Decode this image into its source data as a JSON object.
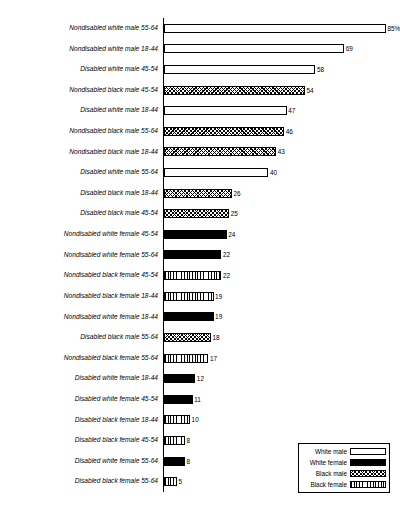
{
  "chart_data": {
    "type": "bar",
    "orientation": "horizontal",
    "title": "",
    "xlabel": "",
    "ylabel": "",
    "xlim": [
      0,
      85
    ],
    "grid": false,
    "legend_position": "bottom-right",
    "value_suffix_first": "%",
    "categories": [
      "Nondisabled white male 55-64",
      "Nondisabled white male 18-44",
      "Disabled white male 45-54",
      "Nondisabled black male 45-54",
      "Disabled white male 18-44",
      "Nondisabled black male 55-64",
      "Nondisabled black male 18-44",
      "Disabled white male 55-64",
      "Disabled black male 18-44",
      "Disabled black male 45-54",
      "Nondisabled white female 45-54",
      "Nondisabled white female 55-64",
      "Nondisabled black female 45-54",
      "Nondisabled black female 18-44",
      "Nondisabled white female 18-44",
      "Disabled black male 55-64",
      "Nondisabled black female 55-64",
      "Disabled white female 18-44",
      "Disabled white female 45-54",
      "Disabled black female 18-44",
      "Disabled black female 45-54",
      "Disabled white female 55-64",
      "Disabled black female 55-64"
    ],
    "values": [
      85,
      69,
      58,
      54,
      47,
      46,
      43,
      40,
      26,
      25,
      24,
      22,
      22,
      19,
      19,
      18,
      17,
      12,
      11,
      10,
      8,
      8,
      5
    ],
    "value_labels": [
      "85%",
      "69",
      "58",
      "54",
      "47",
      "46",
      "43",
      "40",
      "26",
      "25",
      "24",
      "22",
      "22",
      "19",
      "19",
      "18",
      "17",
      "12",
      "11",
      "10",
      "8",
      "8",
      "5"
    ],
    "series_of_bar": [
      "white-male",
      "white-male",
      "white-male",
      "black-male",
      "white-male",
      "black-male",
      "black-male",
      "white-male",
      "black-male",
      "black-male",
      "white-female",
      "white-female",
      "black-female",
      "black-female",
      "white-female",
      "black-male",
      "black-female",
      "white-female",
      "white-female",
      "black-female",
      "black-female",
      "white-female",
      "black-female"
    ],
    "legend": [
      {
        "label": "White male",
        "key": "white-male"
      },
      {
        "label": "White female",
        "key": "white-female"
      },
      {
        "label": "Black male",
        "key": "black-male"
      },
      {
        "label": "Black female",
        "key": "black-female"
      }
    ]
  }
}
